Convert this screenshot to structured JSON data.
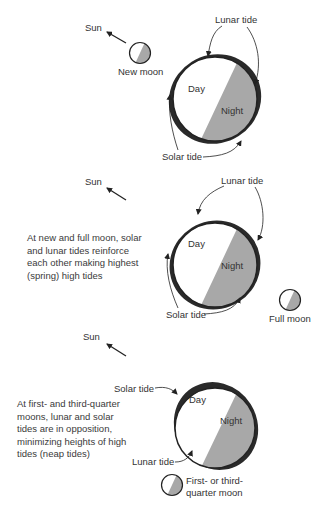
{
  "colors": {
    "night": "#a8a8a8",
    "day": "#ffffff",
    "tide_bulge": "#2a2a2a",
    "outline": "#222222",
    "text": "#333333"
  },
  "panels": [
    {
      "sun_label": "Sun",
      "moon_label": "New moon",
      "lunar_tide_label": "Lunar tide",
      "solar_tide_label": "Solar tide",
      "day_label": "Day",
      "night_label": "Night"
    },
    {
      "sun_label": "Sun",
      "moon_label": "Full moon",
      "lunar_tide_label": "Lunar tide",
      "solar_tide_label": "Solar tide",
      "day_label": "Day",
      "night_label": "Night",
      "caption": [
        "At new and full moon, solar",
        "and lunar tides reinforce",
        "each other making highest",
        "(spring) high tides"
      ]
    },
    {
      "sun_label": "Sun",
      "moon_label": [
        "First- or third-",
        "quarter moon"
      ],
      "lunar_tide_label": "Lunar tide",
      "solar_tide_label": "Solar tide",
      "day_label": "Day",
      "night_label": "Night",
      "caption": [
        "At first- and third-quarter",
        "moons, lunar and solar",
        "tides are in opposition,",
        "minimizing heights of high",
        "tides (neap tides)"
      ]
    }
  ]
}
